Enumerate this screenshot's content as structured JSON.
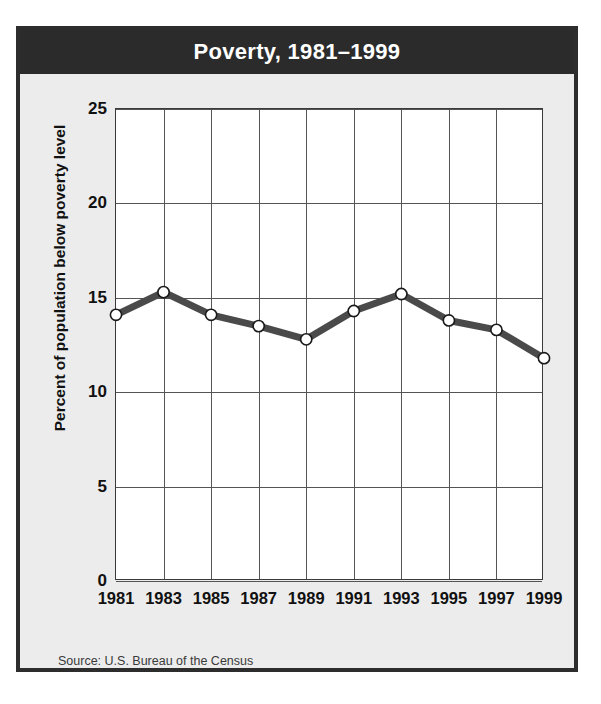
{
  "figure": {
    "title": "Poverty, 1981–1999",
    "source_note": "Source: U.S. Bureau of the Census",
    "colors": {
      "title_bar": "#2b2b2b",
      "title_text": "#ffffff",
      "figure_background": "#ececec",
      "plot_background": "#ffffff",
      "frame_border": "#2d2d2d",
      "grid": "#555555",
      "line": "#4a4a4a",
      "marker_fill": "#ffffff",
      "marker_edge": "#1a1a1a"
    }
  },
  "chart_data": {
    "type": "line",
    "title": "Poverty, 1981–1999",
    "xlabel": "",
    "ylabel": "Percent of population below poverty level",
    "categories": [
      "1981",
      "1983",
      "1985",
      "1987",
      "1989",
      "1991",
      "1993",
      "1995",
      "1997",
      "1999"
    ],
    "x": [
      1981,
      1983,
      1985,
      1987,
      1989,
      1991,
      1993,
      1995,
      1997,
      1999
    ],
    "values": [
      14.1,
      15.3,
      14.1,
      13.5,
      12.8,
      14.3,
      15.2,
      13.8,
      13.3,
      11.8
    ],
    "series": [
      {
        "name": "Percent of population below poverty level",
        "values": [
          14.1,
          15.3,
          14.1,
          13.5,
          12.8,
          14.3,
          15.2,
          13.8,
          13.3,
          11.8
        ]
      }
    ],
    "ylim": [
      0,
      25
    ],
    "yticks": [
      0,
      5,
      10,
      15,
      20,
      25
    ],
    "ytick_labels": [
      "0",
      "5",
      "10",
      "15",
      "20",
      "25"
    ],
    "xtick_labels": [
      "1981",
      "1983",
      "1985",
      "1987",
      "1989",
      "1991",
      "1993",
      "1995",
      "1997",
      "1999"
    ],
    "grid": true,
    "legend": "none",
    "marker": "circle",
    "annotations": [
      "Source: U.S. Bureau of the Census"
    ]
  }
}
